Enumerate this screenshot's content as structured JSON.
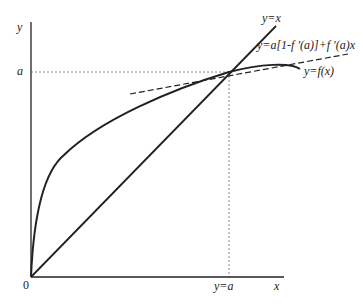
{
  "diagram": {
    "axes": {
      "y_label": "y",
      "x_label": "x",
      "origin_label": "0",
      "y_tick_label": "a",
      "x_tick_label": "y=a"
    },
    "curves": [
      {
        "name": "identity-line",
        "label": "y=x",
        "style": "solid"
      },
      {
        "name": "tangent-line",
        "label": "y=a[1-f '(a)]+f '(a)x",
        "style": "dashed"
      },
      {
        "name": "f-curve",
        "label": "y=f(x)",
        "style": "solid"
      }
    ],
    "guides": {
      "horizontal": "dotted at y=a",
      "vertical": "dotted at x=a"
    },
    "colors": {
      "stroke": "#222222",
      "guide": "#888888",
      "background": "#ffffff"
    }
  }
}
